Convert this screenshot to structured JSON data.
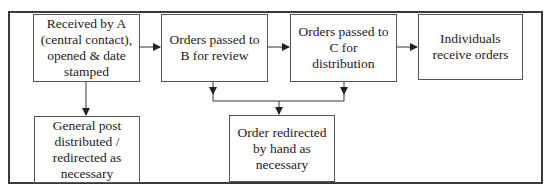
{
  "diagram": {
    "type": "flowchart",
    "nodes": {
      "received": {
        "label": "Received by A\n(central contact),\nopened & date\nstamped"
      },
      "pass_b": {
        "label": "Orders passed to\nB for review"
      },
      "pass_c": {
        "label": "Orders passed to\nC for\ndistribution"
      },
      "individuals": {
        "label": "Individuals\nreceive orders"
      },
      "general_post": {
        "label": "General post\ndistributed /\nredirected as\nnecessary"
      },
      "redirected": {
        "label": "Order redirected\nby hand as\nnecessary"
      }
    },
    "edges": [
      {
        "from": "received",
        "to": "pass_b"
      },
      {
        "from": "pass_b",
        "to": "pass_c"
      },
      {
        "from": "pass_c",
        "to": "individuals"
      },
      {
        "from": "received",
        "to": "general_post"
      },
      {
        "from": "pass_b",
        "to": "redirected"
      },
      {
        "from": "pass_c",
        "to": "redirected"
      }
    ],
    "colors": {
      "line": "#333333",
      "border": "#555555",
      "background": "#ffffff"
    }
  }
}
